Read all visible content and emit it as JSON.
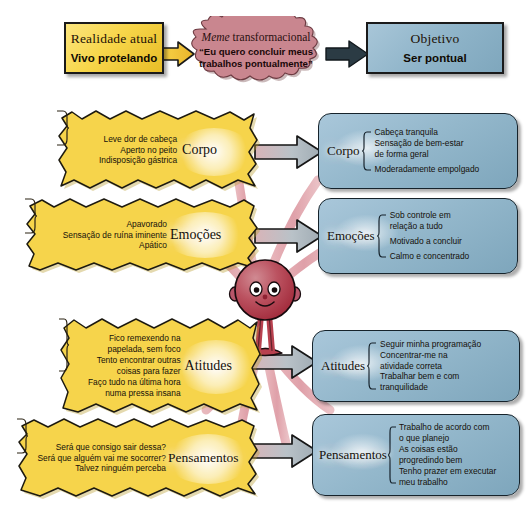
{
  "diagram": {
    "colors": {
      "yellow": "#f7d64a",
      "blue": "#8fb4c9",
      "cloud": "#c98a92",
      "ribbon": "#e0a0a8",
      "arrow_fill": "#b9c2c8",
      "outline": "#1a1a1a",
      "character": "#b8414f",
      "background": "#ffffff"
    },
    "top": {
      "current": {
        "title": "Realidade atual",
        "value": "Vivo protelando"
      },
      "meme": {
        "title": "Meme",
        "title_rest": " transformacional",
        "quote": "“Eu quero concluir meus trabalhos pontualmente”"
      },
      "goal": {
        "title": "Objetivo",
        "value": "Ser pontual"
      }
    },
    "rows": [
      {
        "key": "corpo",
        "left": {
          "label": "Corpo",
          "items": [
            "Leve dor de cabeça",
            "Aperto no peito",
            "Indisposição gástrica"
          ]
        },
        "right": {
          "label": "Corpo",
          "items": [
            "Cabeça tranquila",
            "Sensação de bem-estar",
            "de forma geral",
            "Moderadamente empolgado"
          ]
        }
      },
      {
        "key": "emocoes",
        "left": {
          "label": "Emoções",
          "items": [
            "Apavorado",
            "Sensação de ruína iminente",
            "Apático"
          ]
        },
        "right": {
          "label": "Emoções",
          "items": [
            "Sob controle em",
            "relação a tudo",
            "Motivado a concluir",
            "Calmo e concentrado"
          ]
        }
      },
      {
        "key": "atitudes",
        "left": {
          "label": "Atitudes",
          "items": [
            "Fico remexendo na",
            "papelada, sem foco",
            "Tento encontrar outras",
            "coisas para fazer",
            "Faço tudo na última hora",
            "numa pressa insana"
          ]
        },
        "right": {
          "label": "Atitudes",
          "items": [
            "Seguir minha programação",
            "Concentrar-me na",
            "atividade correta",
            "Trabalhar bem e com",
            "tranquilidade"
          ]
        }
      },
      {
        "key": "pensamentos",
        "left": {
          "label": "Pensamentos",
          "items": [
            "Será que consigo sair dessa?",
            "Será que alguém vai me socorrer?",
            "Talvez ninguém perceba"
          ]
        },
        "right": {
          "label": "Pensamentos",
          "items": [
            "Trabalho de acordo com",
            "o que planejo",
            "As coisas estão",
            "progredindo bem",
            "Tenho prazer em executar",
            "meu trabalho"
          ]
        }
      }
    ]
  }
}
